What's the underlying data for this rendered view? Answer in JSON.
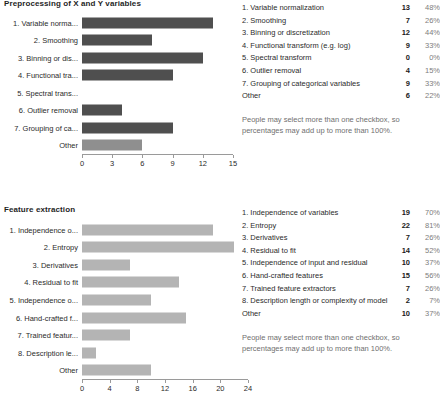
{
  "charts": [
    {
      "id": "preprocessing",
      "title": "Preprocessing of X and Y variables",
      "bar_color": "#4f4f4f",
      "other_bar_color": "#8f8f8f",
      "note": "People may select more than one checkbox, so\npercentages may add up to more than 100%.",
      "count_header": "",
      "chart_data": {
        "type": "bar",
        "orientation": "horizontal",
        "title": "Preprocessing of X and Y variables",
        "xlabel": "",
        "ylabel": "",
        "xlim": [
          0,
          15
        ],
        "grid": false,
        "ticks": [
          0,
          3,
          6,
          9,
          12,
          15
        ],
        "categories": [
          "1. Variable norma...",
          "2. Smoothing",
          "3. Binning or dis...",
          "4. Functional tra...",
          "5. Spectral trans...",
          "6. Outlier removal",
          "7. Grouping of ca...",
          "Other"
        ],
        "values": [
          13,
          7,
          12,
          9,
          0,
          4,
          9,
          6
        ]
      },
      "rows": [
        {
          "label": "1. Variable normalization",
          "count": "13",
          "pct": "48%"
        },
        {
          "label": "2. Smoothing",
          "count": "7",
          "pct": "26%"
        },
        {
          "label": "3. Binning or discretization",
          "count": "12",
          "pct": "44%"
        },
        {
          "label": "4. Functional transform (e.g. log)",
          "count": "9",
          "pct": "33%"
        },
        {
          "label": "5. Spectral transform",
          "count": "0",
          "pct": "0%"
        },
        {
          "label": "6. Outlier removal",
          "count": "4",
          "pct": "15%"
        },
        {
          "label": "7. Grouping of categorical variables",
          "count": "9",
          "pct": "33%"
        },
        {
          "label": "Other",
          "count": "6",
          "pct": "22%"
        }
      ]
    },
    {
      "id": "feature-extraction",
      "title": "Feature extraction",
      "bar_color": "#b4b4b4",
      "other_bar_color": "#b4b4b4",
      "note": "People may select more than one checkbox, so\npercentages may add up to more than 100%.",
      "count_header": "",
      "chart_data": {
        "type": "bar",
        "orientation": "horizontal",
        "title": "Feature extraction",
        "xlabel": "",
        "ylabel": "",
        "xlim": [
          0,
          24
        ],
        "grid": false,
        "ticks": [
          0,
          4,
          8,
          12,
          16,
          20,
          24
        ],
        "categories": [
          "1. Independence o...",
          "2. Entropy",
          "3. Derivatives",
          "4. Residual to fit",
          "5. Independence o...",
          "6. Hand-crafted f...",
          "7. Trained featur...",
          "8. Description le...",
          "Other"
        ],
        "values": [
          19,
          22,
          7,
          14,
          10,
          15,
          7,
          2,
          10
        ]
      },
      "rows": [
        {
          "label": "1. Independence of variables",
          "count": "19",
          "pct": "70%"
        },
        {
          "label": "2. Entropy",
          "count": "22",
          "pct": "81%"
        },
        {
          "label": "3. Derivatives",
          "count": "7",
          "pct": "26%"
        },
        {
          "label": "4. Residual to fit",
          "count": "14",
          "pct": "52%"
        },
        {
          "label": "5. Independence of input and residual",
          "count": "10",
          "pct": "37%"
        },
        {
          "label": "6. Hand-crafted features",
          "count": "15",
          "pct": "56%"
        },
        {
          "label": "7. Trained feature extractors",
          "count": "7",
          "pct": "26%"
        },
        {
          "label": "8. Description length or complexity of model",
          "count": "2",
          "pct": "7%"
        },
        {
          "label": "Other",
          "count": "10",
          "pct": "37%"
        }
      ]
    }
  ]
}
